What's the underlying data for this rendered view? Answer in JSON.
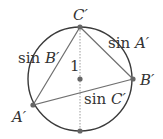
{
  "diagram": {
    "circle": {
      "cx": 80,
      "cy": 79,
      "r": 52,
      "stroke": "#3a3a3a"
    },
    "center": {
      "x": 80,
      "y": 79
    },
    "points": {
      "C": {
        "x": 80,
        "y": 27,
        "label": "C′"
      },
      "B": {
        "x": 133,
        "y": 79,
        "label": "B′"
      },
      "A": {
        "x": 33,
        "y": 105,
        "label": "A′"
      },
      "bottom": {
        "x": 80,
        "y": 131
      }
    },
    "labels": {
      "radius": "1",
      "side_a": "sin A′",
      "side_b": "sin B′",
      "side_c": "sin C′",
      "sin_a_prefix": "sin",
      "sin_a_var": "A′",
      "sin_b_prefix": "sin",
      "sin_b_var": "B′",
      "sin_c_prefix": "sin",
      "sin_c_var": "C′"
    },
    "colors": {
      "line": "#6e6e6e",
      "point": "#666666",
      "dotted": "#999999"
    }
  }
}
